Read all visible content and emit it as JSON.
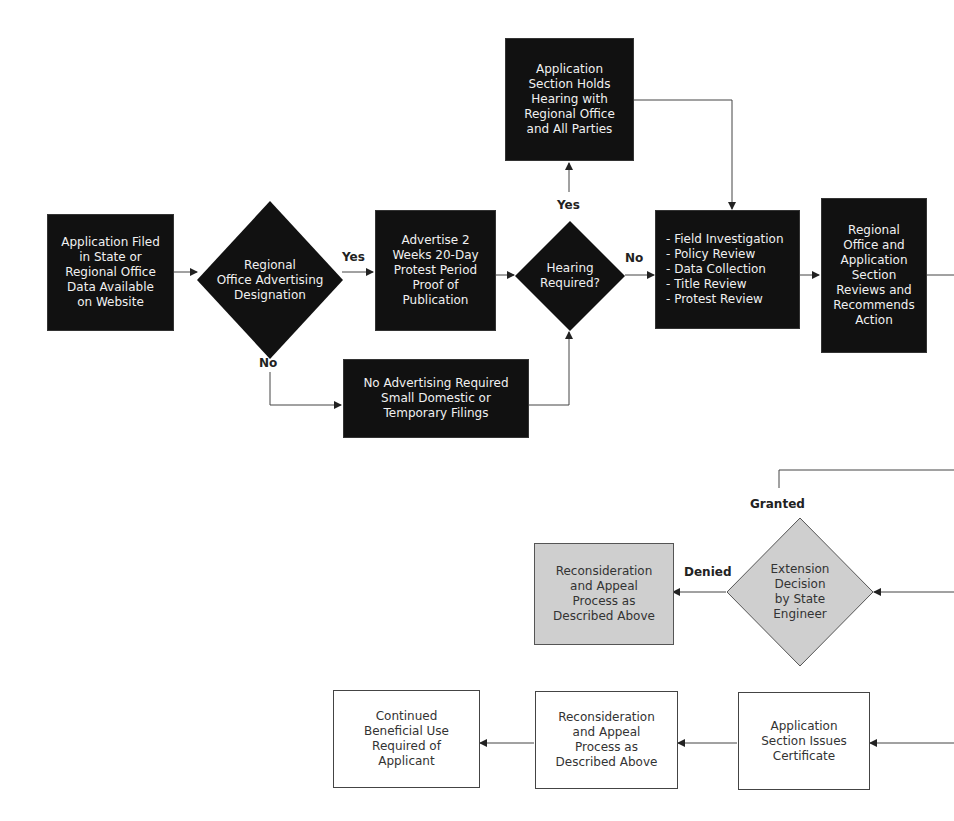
{
  "colors": {
    "dark_fill": "#111111",
    "dark_text": "#f0f0f0",
    "gray_fill": "#cfcfcf",
    "line": "#444444"
  },
  "top_flow": {
    "filed": "Application Filed\nin State or\nRegional Office\nData Available\non Website",
    "advertising_decision": "Regional\nOffice Advertising\nDesignation",
    "advertise": "Advertise 2\nWeeks 20-Day\nProtest Period\nProof of\nPublication",
    "no_advertising": "No Advertising Required\nSmall Domestic or\nTemporary Filings",
    "hearing_decision": "Hearing\nRequired?",
    "hearing": "Application\nSection Holds\nHearing with\nRegional Office\nand All Parties",
    "review_list": "- Field Investigation\n- Policy Review\n- Data Collection\n- Title Review\n- Protest Review",
    "regional_review": "Regional\nOffice and\nApplication\nSection\nReviews and\nRecommends\nAction"
  },
  "extension_flow": {
    "decision": "Extension\nDecision\nby State\nEngineer",
    "reconsideration": "Reconsideration\nand Appeal\nProcess as\nDescribed Above"
  },
  "certificate_flow": {
    "certificate": "Application\nSection Issues\nCertificate",
    "reconsideration": "Reconsideration\nand Appeal\nProcess as\nDescribed Above",
    "continued_use": "Continued\nBeneficial Use\nRequired of\nApplicant"
  },
  "labels": {
    "adv_yes": "Yes",
    "adv_no": "No",
    "hearing_yes": "Yes",
    "hearing_no": "No",
    "granted": "Granted",
    "denied": "Denied"
  }
}
